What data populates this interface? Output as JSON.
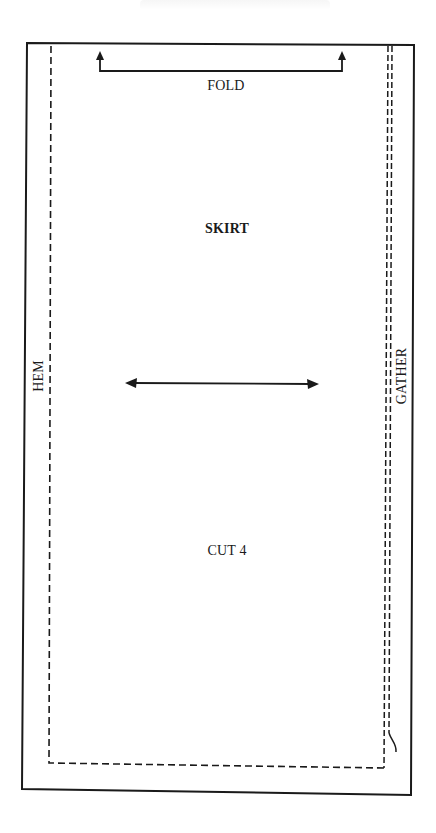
{
  "pattern": {
    "piece_name": "SKIRT",
    "instructions": {
      "fold": "FOLD",
      "cut": "CUT 4",
      "hem": "HEM",
      "gather": "GATHER"
    },
    "markings": {
      "fold_bracket": "fold-line bracket with upward arrows at both ends",
      "grainline": "horizontal double-headed grainline arrow",
      "seam_allowance_left_bottom": "dashed stitching line",
      "gather_lines": "double dashed gathering lines on right edge"
    }
  },
  "colors": {
    "ink": "#1a1a1a",
    "paper": "#ffffff"
  }
}
